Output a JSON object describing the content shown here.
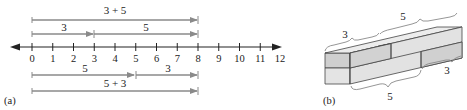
{
  "panel_a": {
    "label": "(a)",
    "number_line": {
      "min": 0,
      "max": 12,
      "ticks": [
        "0",
        "1",
        "2",
        "3",
        "4",
        "5",
        "6",
        "7",
        "8",
        "9",
        "10",
        "11",
        "12"
      ]
    },
    "top_sum_label": "3 + 5",
    "top_segment_1_label": "3",
    "top_segment_2_label": "5",
    "bottom_segment_1_label": "5",
    "bottom_segment_2_label": "3",
    "bottom_sum_label": "5 + 3"
  },
  "panel_b": {
    "label": "(b)",
    "top_left_brace_label": "3",
    "top_right_brace_label": "5",
    "bottom_left_brace_label": "5",
    "bottom_right_brace_label": "3"
  },
  "colors": {
    "arrow": "#8a8a8a",
    "axis": "#222222",
    "block_front": "#cfcfcf",
    "block_top": "#e6e6e6",
    "block_side": "#dcdcdc",
    "edge": "#444444"
  }
}
